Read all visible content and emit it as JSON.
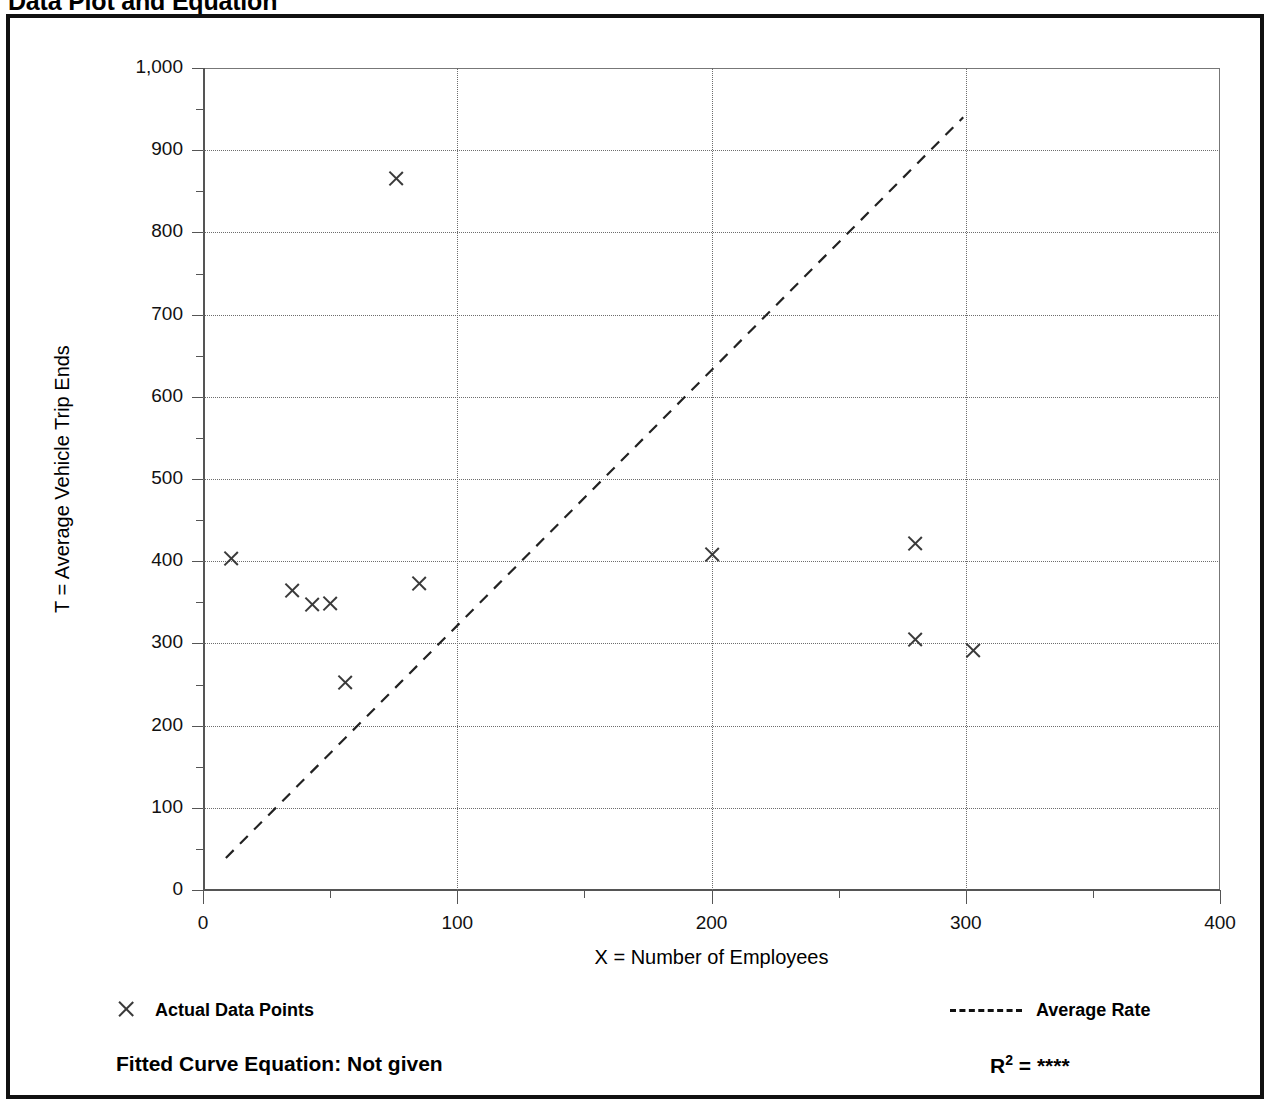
{
  "page": {
    "title": "Data Plot and Equation"
  },
  "chart_data": {
    "type": "scatter",
    "title": "Data Plot and Equation",
    "xlabel": "X = Number of Employees",
    "ylabel": "T = Average Vehicle Trip Ends",
    "xlim": [
      0,
      400
    ],
    "ylim": [
      0,
      1000
    ],
    "x_ticks": [
      0,
      100,
      200,
      300,
      400
    ],
    "x_tick_labels": [
      "0",
      "100",
      "200",
      "300",
      "400"
    ],
    "x_minor_ticks": [
      50,
      150,
      250,
      350
    ],
    "y_ticks": [
      0,
      100,
      200,
      300,
      400,
      500,
      600,
      700,
      800,
      900,
      1000
    ],
    "y_tick_labels": [
      "0",
      "100",
      "200",
      "300",
      "400",
      "500",
      "600",
      "700",
      "800",
      "900",
      "1,000"
    ],
    "y_minor_ticks": [
      50,
      150,
      250,
      350,
      450,
      550,
      650,
      750,
      850,
      950
    ],
    "grid": "dotted",
    "legend_position": "below-plot",
    "series": [
      {
        "name": "Actual Data Points",
        "type": "scatter",
        "marker": "x",
        "points": [
          {
            "x": 11,
            "y": 403
          },
          {
            "x": 35,
            "y": 364
          },
          {
            "x": 43,
            "y": 347
          },
          {
            "x": 50,
            "y": 349
          },
          {
            "x": 56,
            "y": 253
          },
          {
            "x": 76,
            "y": 866
          },
          {
            "x": 85,
            "y": 373
          },
          {
            "x": 200,
            "y": 408
          },
          {
            "x": 280,
            "y": 422
          },
          {
            "x": 280,
            "y": 305
          },
          {
            "x": 303,
            "y": 291
          }
        ]
      },
      {
        "name": "Average Rate",
        "type": "line",
        "style": "dashed",
        "endpoints": [
          {
            "x": 9,
            "y": 39
          },
          {
            "x": 299,
            "y": 940
          }
        ]
      }
    ]
  },
  "legend": {
    "points_label": "Actual Data Points",
    "rate_label": "Average Rate",
    "points_marker_icon": "x-marker-icon",
    "rate_marker_icon": "dashed-line-icon"
  },
  "footer": {
    "equation_label": "Fitted Curve Equation:  Not given",
    "r2_label": "R",
    "r2_exponent": "2",
    "r2_equals": " = ",
    "r2_value": "****"
  }
}
